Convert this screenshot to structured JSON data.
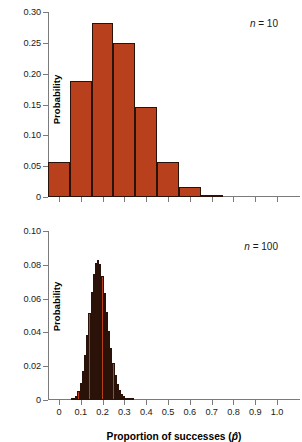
{
  "figure": {
    "xlabel_prefix": "Proportion of successes (",
    "xlabel_symbol": "p̂",
    "xlabel_suffix": ")",
    "bar_color": "#b8401c",
    "bar_edge_color": "#2b1208",
    "axis_color": "#7b7b7b"
  },
  "chart_data": [
    {
      "type": "bar",
      "title": "",
      "annotation": "n = 10",
      "annotation_symbol": "n",
      "annotation_value": "= 10",
      "xlabel": "",
      "ylabel": "Probability",
      "xlim": [
        -0.05,
        1.05
      ],
      "ylim": [
        0,
        0.3
      ],
      "yticks": [
        0,
        0.05,
        0.1,
        0.15,
        0.2,
        0.25,
        0.3
      ],
      "ytick_labels": [
        "0",
        "0.05",
        "0.10",
        "0.15",
        "0.20",
        "0.25",
        "0.30"
      ],
      "xticks": [
        0,
        0.1,
        0.2,
        0.3,
        0.4,
        0.5,
        0.6,
        0.7,
        0.8,
        0.9,
        1.0
      ],
      "xtick_labels": [
        "",
        "",
        "",
        "",
        "",
        "",
        "",
        "",
        "",
        "",
        ""
      ],
      "grid": false,
      "bar_width": 0.1,
      "categories": [
        "0.0",
        "0.1",
        "0.2",
        "0.3",
        "0.4",
        "0.5",
        "0.6",
        "0.7",
        "0.8",
        "0.9",
        "1.0"
      ],
      "x": [
        0.0,
        0.1,
        0.2,
        0.3,
        0.4,
        0.5,
        0.6,
        0.7,
        0.8,
        0.9,
        1.0
      ],
      "values": [
        0.0563,
        0.1877,
        0.2816,
        0.2503,
        0.146,
        0.0573,
        0.0155,
        0.0028,
        0.0003,
        0.0,
        0.0
      ]
    },
    {
      "type": "bar",
      "title": "",
      "annotation": "n = 100",
      "annotation_symbol": "n",
      "annotation_value": "= 100",
      "xlabel": "Proportion of successes (p̂)",
      "ylabel": "Probability",
      "xlim": [
        -0.05,
        1.05
      ],
      "ylim": [
        0,
        0.1
      ],
      "yticks": [
        0,
        0.02,
        0.04,
        0.06,
        0.08,
        0.1
      ],
      "ytick_labels": [
        "0",
        "0.02",
        "0.04",
        "0.06",
        "0.08",
        "0.10"
      ],
      "xticks": [
        0,
        0.1,
        0.2,
        0.3,
        0.4,
        0.5,
        0.6,
        0.7,
        0.8,
        0.9,
        1.0
      ],
      "xtick_labels": [
        "0",
        "0.1",
        "0.2",
        "0.3",
        "0.4",
        "0.5",
        "0.6",
        "0.7",
        "0.8",
        "0.9",
        "1.0"
      ],
      "grid": false,
      "bar_width": 0.01,
      "x": [
        0.06,
        0.07,
        0.08,
        0.09,
        0.1,
        0.11,
        0.12,
        0.13,
        0.14,
        0.15,
        0.16,
        0.17,
        0.18,
        0.19,
        0.2,
        0.21,
        0.22,
        0.23,
        0.24,
        0.25,
        0.26,
        0.27,
        0.28,
        0.29,
        0.3,
        0.31,
        0.32,
        0.33,
        0.34,
        0.35,
        0.36,
        0.37,
        0.38,
        0.39,
        0.4
      ],
      "values": [
        0.0004,
        0.0011,
        0.0026,
        0.0054,
        0.0101,
        0.0172,
        0.0268,
        0.0386,
        0.0515,
        0.064,
        0.0744,
        0.0811,
        0.0831,
        0.0803,
        0.0734,
        0.0636,
        0.0523,
        0.0409,
        0.0305,
        0.0217,
        0.0148,
        0.0096,
        0.006,
        0.0036,
        0.0021,
        0.0012,
        0.0006,
        0.0003,
        0.0002,
        0.0001,
        4e-05,
        2e-05,
        1e-05,
        5e-06,
        2e-06
      ]
    }
  ]
}
